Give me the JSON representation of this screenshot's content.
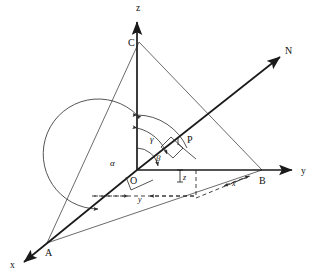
{
  "figure": {
    "background_color": "#ffffff",
    "stroke_color": "#1a1a1a",
    "thin_stroke_color": "#3a3a3a"
  },
  "axes": [
    {
      "id": "x",
      "label": "x",
      "label_x": 10,
      "label_y": 268,
      "direction": "down-left"
    },
    {
      "id": "y",
      "label": "y",
      "label_x": 301,
      "label_y": 174,
      "direction": "right"
    },
    {
      "id": "z",
      "label": "z",
      "label_x": 136,
      "label_y": 11,
      "direction": "up"
    }
  ],
  "points": [
    {
      "id": "O",
      "label": "O",
      "label_x": 130,
      "label_y": 184,
      "x": 137,
      "y": 170
    },
    {
      "id": "A",
      "label": "A",
      "label_x": 45,
      "label_y": 256,
      "x": 47,
      "y": 243
    },
    {
      "id": "B",
      "label": "B",
      "label_x": 259,
      "label_y": 184,
      "x": 262,
      "y": 170
    },
    {
      "id": "C",
      "label": "C",
      "label_x": 128,
      "label_y": 46,
      "x": 139,
      "y": 42
    },
    {
      "id": "P",
      "label": "P",
      "label_x": 187,
      "label_y": 143,
      "x": 178,
      "y": 144
    },
    {
      "id": "N",
      "label": "N",
      "label_x": 285,
      "label_y": 54,
      "x": 277,
      "y": 60
    }
  ],
  "angles": [
    {
      "id": "alpha",
      "label": "α",
      "label_x": 110,
      "label_y": 166,
      "between": "z-axis to x-axis"
    },
    {
      "id": "beta",
      "label": "β",
      "label_x": 156,
      "label_y": 161,
      "between": "y-axis to OP"
    },
    {
      "id": "gamma",
      "label": "γ",
      "label_x": 150,
      "label_y": 142,
      "between": "z-axis to OP"
    }
  ],
  "component_labels": [
    {
      "id": "x-component",
      "label": "x",
      "label_x": 232,
      "label_y": 186
    },
    {
      "id": "y-component",
      "label": "y",
      "label_x": 138,
      "label_y": 202
    },
    {
      "id": "z-component",
      "label": "z",
      "label_x": 183,
      "label_y": 180
    }
  ],
  "lines": {
    "triangle": [
      "C-A",
      "C-B",
      "A-B"
    ],
    "normal_ray": "O-N",
    "segment": "O-P"
  }
}
